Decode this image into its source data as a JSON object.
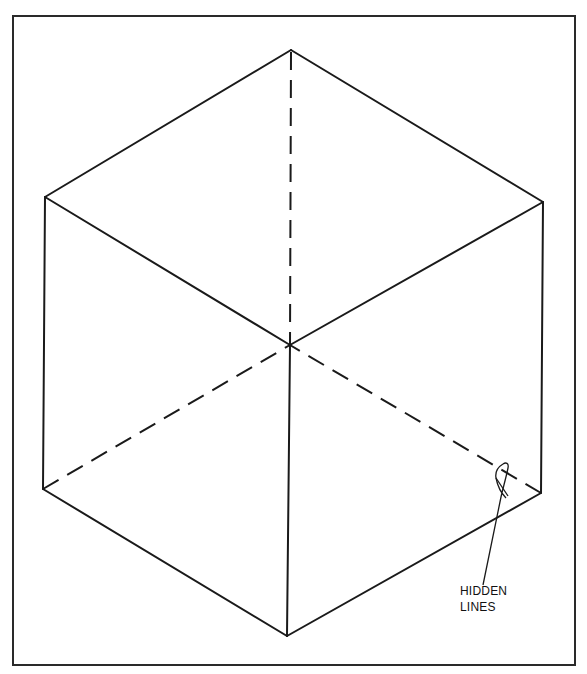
{
  "figure": {
    "type": "isometric cube line drawing",
    "stroke_color": "#1a1a1a",
    "background": "#ffffff",
    "annotation": {
      "line1": "HIDDEN",
      "line2": "LINES"
    },
    "vertices": {
      "top": [
        291,
        50
      ],
      "upper_left": [
        45,
        197
      ],
      "upper_right": [
        543,
        202
      ],
      "lower_left": [
        43,
        489
      ],
      "lower_right": [
        541,
        493
      ],
      "bottom": [
        287,
        636
      ],
      "center": [
        290,
        345
      ]
    },
    "visible_edges": [
      [
        "top",
        "upper_left"
      ],
      [
        "top",
        "upper_right"
      ],
      [
        "upper_left",
        "center"
      ],
      [
        "upper_right",
        "center"
      ],
      [
        "center",
        "bottom"
      ],
      [
        "upper_left",
        "lower_left"
      ],
      [
        "upper_right",
        "lower_right"
      ],
      [
        "lower_left",
        "bottom"
      ],
      [
        "lower_right",
        "bottom"
      ]
    ],
    "hidden_edges": [
      [
        "top",
        "center"
      ],
      [
        "lower_left",
        "center"
      ],
      [
        "lower_right",
        "center"
      ]
    ]
  }
}
